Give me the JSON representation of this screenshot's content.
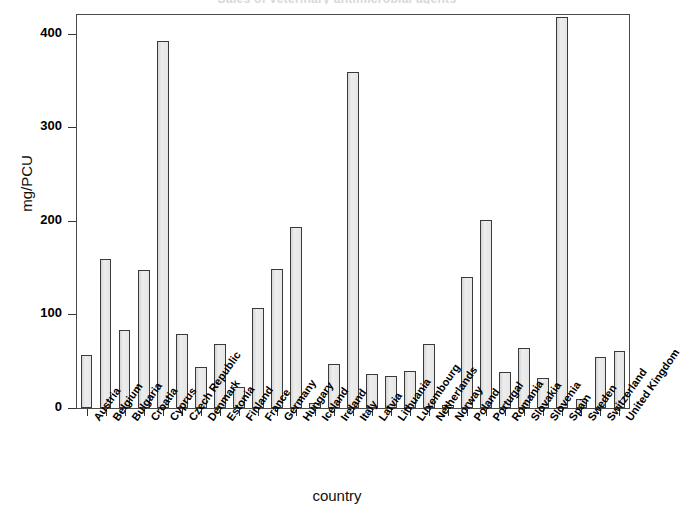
{
  "chart_data": {
    "type": "bar",
    "title": "Sales of veterinary antimicrobial agents",
    "xlabel": "country",
    "ylabel": "mg/PCU",
    "ylim": [
      0,
      420
    ],
    "yticks": [
      0,
      100,
      200,
      300,
      400
    ],
    "ytick_labels": [
      "0",
      "100",
      "200",
      "300",
      "400"
    ],
    "grid": false,
    "legend": "none",
    "bar_color": "#e6e6e6",
    "bar_edge_color": "#3a3a3a",
    "categories": [
      "Austria",
      "Belgium",
      "Bulgaria",
      "Croatia",
      "Cyprus",
      "Czech Republic",
      "Denmark",
      "Estonia",
      "Finland",
      "France",
      "Germany",
      "Hungary",
      "Iceland",
      "Ireland",
      "Italy",
      "Latvia",
      "Lithuania",
      "Luxembourg",
      "Netherlands",
      "Norway",
      "Poland",
      "Portugal",
      "Romania",
      "Slovakia",
      "Slovenia",
      "Spain",
      "Sweden",
      "Switzerland",
      "United Kingdom"
    ],
    "values": [
      57,
      159,
      83,
      147,
      392,
      79,
      44,
      68,
      22,
      107,
      149,
      193,
      5,
      47,
      359,
      36,
      34,
      40,
      68,
      3,
      140,
      201,
      38,
      64,
      32,
      418,
      10,
      55,
      61
    ]
  },
  "axes": {
    "y_title": "mg/PCU",
    "x_title": "country"
  }
}
